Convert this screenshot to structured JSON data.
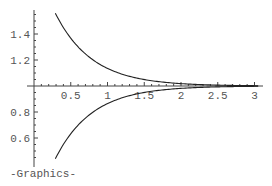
{
  "chart_data": {
    "type": "line",
    "title": "",
    "xlabel": "",
    "ylabel": "",
    "xlim": [
      0,
      3.05
    ],
    "ylim": [
      0.45,
      1.6
    ],
    "x_axis_crosses_y_at": 1.0,
    "grid": false,
    "legend": null,
    "x_ticks": [
      0.5,
      1,
      1.5,
      2,
      2.5,
      3
    ],
    "x_tick_labels": [
      "0.5",
      "1",
      "1.5",
      "2",
      "2.5",
      "3"
    ],
    "y_ticks": [
      0.6,
      0.8,
      1.2,
      1.4
    ],
    "y_tick_labels": [
      "0.6",
      "0.8",
      "1.2",
      "1.4"
    ],
    "series": [
      {
        "name": "upper",
        "expression": "1 + e^(-2x)",
        "x": [
          0.29,
          0.5,
          0.75,
          1.0,
          1.25,
          1.5,
          1.75,
          2.0,
          2.5,
          3.0
        ],
        "values": [
          1.56,
          1.37,
          1.22,
          1.14,
          1.08,
          1.05,
          1.03,
          1.02,
          1.01,
          1.0
        ]
      },
      {
        "name": "lower",
        "expression": "1 - e^(-2x)",
        "x": [
          0.29,
          0.5,
          0.75,
          1.0,
          1.25,
          1.5,
          1.75,
          2.0,
          2.5,
          3.0
        ],
        "values": [
          0.44,
          0.63,
          0.78,
          0.86,
          0.92,
          0.95,
          0.97,
          0.98,
          0.99,
          1.0
        ]
      }
    ]
  },
  "output": {
    "caption": "-Graphics-"
  }
}
